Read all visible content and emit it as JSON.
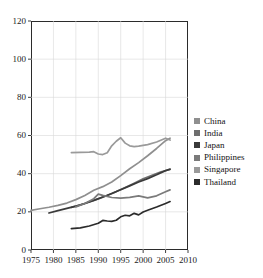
{
  "chart_data": {
    "type": "line",
    "title": "",
    "xlabel": "",
    "ylabel": "",
    "xlim": [
      1975,
      2010
    ],
    "ylim": [
      0,
      120
    ],
    "xticks": [
      1975,
      1980,
      1985,
      1990,
      1995,
      2000,
      2005,
      2010
    ],
    "yticks": [
      0,
      20,
      40,
      60,
      80,
      100,
      120
    ],
    "grid": true,
    "legend_position": "right",
    "series": [
      {
        "name": "China",
        "color": "#8f8f8f",
        "x": [
          1975,
          1977,
          1979,
          1981,
          1983,
          1985,
          1987,
          1989,
          1991,
          1993,
          1995,
          1997,
          1999,
          2001,
          2003,
          2005,
          2006
        ],
        "values": [
          20.8,
          21.6,
          22.4,
          23.4,
          24.6,
          26.4,
          28.6,
          31.3,
          33.2,
          35.6,
          39.0,
          42.6,
          45.8,
          49.4,
          53.2,
          57.3,
          58.6
        ]
      },
      {
        "name": "India",
        "color": "#6e6e6e",
        "x": [
          1984,
          1986,
          1988,
          1990,
          1992,
          1994,
          1996,
          1998,
          2000,
          2002,
          2004,
          2006
        ],
        "values": [
          22.3,
          23.6,
          25.2,
          26.8,
          28.6,
          30.6,
          32.8,
          35.0,
          37.3,
          39.2,
          41.0,
          42.2
        ]
      },
      {
        "name": "Japan",
        "color": "#3a3a3a",
        "x": [
          1979,
          1981,
          1983,
          1985,
          1987,
          1989,
          1991,
          1993,
          1995,
          1997,
          1999,
          2001,
          2003,
          2005,
          2006
        ],
        "values": [
          19.4,
          20.6,
          21.8,
          23.0,
          24.4,
          26.0,
          27.8,
          29.6,
          31.6,
          33.6,
          35.6,
          37.4,
          39.4,
          41.6,
          42.4
        ]
      },
      {
        "name": "Philippines",
        "color": "#7a7a7a",
        "x": [
          1985,
          1987,
          1989,
          1990,
          1991,
          1993,
          1995,
          1997,
          1999,
          2001,
          2003,
          2005,
          2006
        ],
        "values": [
          22.6,
          24.4,
          26.9,
          29.3,
          28.6,
          27.5,
          27.2,
          27.6,
          28.4,
          27.3,
          28.4,
          30.5,
          31.5
        ]
      },
      {
        "name": "Singapore",
        "color": "#9a9a9a",
        "x": [
          1984,
          1986,
          1988,
          1989,
          1990,
          1991,
          1992,
          1993,
          1994,
          1995,
          1996,
          1997,
          1998,
          1999,
          2001,
          2003,
          2005,
          2006
        ],
        "values": [
          51.0,
          51.2,
          51.3,
          51.5,
          50.3,
          50.0,
          51.0,
          54.6,
          57.0,
          58.8,
          56.0,
          54.6,
          54.2,
          54.4,
          55.2,
          56.6,
          58.6,
          57.6
        ]
      },
      {
        "name": "Thailand",
        "color": "#2b2b2b",
        "x": [
          1984,
          1986,
          1988,
          1990,
          1991,
          1992,
          1993,
          1994,
          1995,
          1996,
          1997,
          1998,
          1999,
          2000,
          2001,
          2003,
          2005,
          2006
        ],
        "values": [
          11.2,
          11.6,
          12.6,
          14.0,
          15.5,
          15.2,
          15.0,
          15.6,
          17.4,
          18.2,
          17.9,
          19.2,
          18.4,
          19.9,
          20.8,
          22.5,
          24.4,
          25.4
        ]
      }
    ]
  },
  "axes": {
    "y_tick_labels": [
      "120",
      "100",
      "80",
      "60",
      "40",
      "20",
      "0"
    ],
    "x_tick_labels": [
      "1975",
      "1980",
      "1985",
      "1990",
      "1995",
      "2000",
      "2005",
      "2010"
    ]
  },
  "legend": {
    "items": [
      {
        "label": "China",
        "color": "#8f8f8f"
      },
      {
        "label": "India",
        "color": "#6e6e6e"
      },
      {
        "label": "Japan",
        "color": "#3a3a3a"
      },
      {
        "label": "Philippines",
        "color": "#7a7a7a"
      },
      {
        "label": "Singapore",
        "color": "#9a9a9a"
      },
      {
        "label": "Thailand",
        "color": "#2b2b2b"
      }
    ]
  }
}
